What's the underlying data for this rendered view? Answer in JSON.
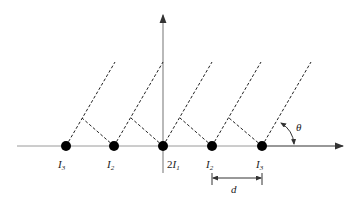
{
  "diagram": {
    "type": "grating-diffraction",
    "axes": {
      "horizontal": "x-axis",
      "vertical": "y-axis"
    },
    "sources": [
      {
        "label": "I",
        "sub": "3",
        "prefix": "",
        "x": 66
      },
      {
        "label": "I",
        "sub": "2",
        "prefix": "",
        "x": 114
      },
      {
        "label": "I",
        "sub": "1",
        "prefix": "2",
        "x": 163
      },
      {
        "label": "I",
        "sub": "2",
        "prefix": "",
        "x": 212
      },
      {
        "label": "I",
        "sub": "3",
        "prefix": "",
        "x": 262
      }
    ],
    "spacing_label": "d",
    "angle_label": "θ",
    "colors": {
      "axis": "#8a8a8a",
      "dot": "#000000",
      "dash": "#222222"
    }
  }
}
